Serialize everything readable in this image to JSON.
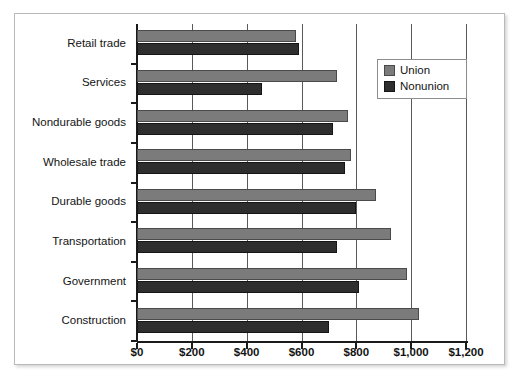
{
  "chart_data": {
    "type": "bar",
    "orientation": "horizontal",
    "title": "",
    "xlabel": "",
    "ylabel": "",
    "xlim": [
      0,
      1200
    ],
    "grid": true,
    "legend_position": "top-right",
    "categories": [
      "Retail trade",
      "Services",
      "Nondurable goods",
      "Wholesale trade",
      "Durable goods",
      "Transportation",
      "Government",
      "Construction"
    ],
    "series": [
      {
        "name": "Union",
        "color": "#7b7b7b",
        "values": [
          580,
          730,
          770,
          780,
          870,
          925,
          985,
          1030
        ]
      },
      {
        "name": "Nonunion",
        "color": "#2e2e2e",
        "values": [
          590,
          455,
          715,
          760,
          800,
          730,
          810,
          700
        ]
      }
    ],
    "x_ticks": [
      {
        "value": 0,
        "label": "$0"
      },
      {
        "value": 200,
        "label": "$200"
      },
      {
        "value": 400,
        "label": "$400"
      },
      {
        "value": 600,
        "label": "$600"
      },
      {
        "value": 800,
        "label": "$800"
      },
      {
        "value": 1000,
        "label": "$1,000"
      },
      {
        "value": 1200,
        "label": "$1,200"
      }
    ]
  },
  "legend": {
    "items": [
      {
        "label": "Union",
        "swatch": "union"
      },
      {
        "label": "Nonunion",
        "swatch": "nonunion"
      }
    ]
  }
}
